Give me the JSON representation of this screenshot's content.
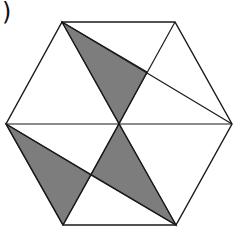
{
  "label": ")",
  "diagram": {
    "type": "hexagon-shaded-triangles",
    "fill_color": "#7d7d7d",
    "stroke_color": "#1a1a1a",
    "vertices": {
      "TL": [
        62,
        22
      ],
      "TR": [
        175,
        22
      ],
      "R": [
        232,
        124
      ],
      "BR": [
        176,
        225
      ],
      "BL": [
        63,
        225
      ],
      "L": [
        6,
        124
      ],
      "C": [
        119,
        124
      ],
      "P1": [
        147,
        72
      ],
      "P2": [
        91,
        175
      ]
    },
    "shaded_triangles": [
      [
        "TL",
        "P1",
        "C"
      ],
      [
        "L",
        "P2",
        "BL"
      ],
      [
        "C",
        "P2",
        "BR"
      ]
    ],
    "lines": [
      [
        "L",
        "R"
      ],
      [
        "TR",
        "BL"
      ],
      [
        "TL",
        "BR"
      ],
      [
        "TL",
        "R"
      ],
      [
        "L",
        "BR"
      ]
    ]
  }
}
